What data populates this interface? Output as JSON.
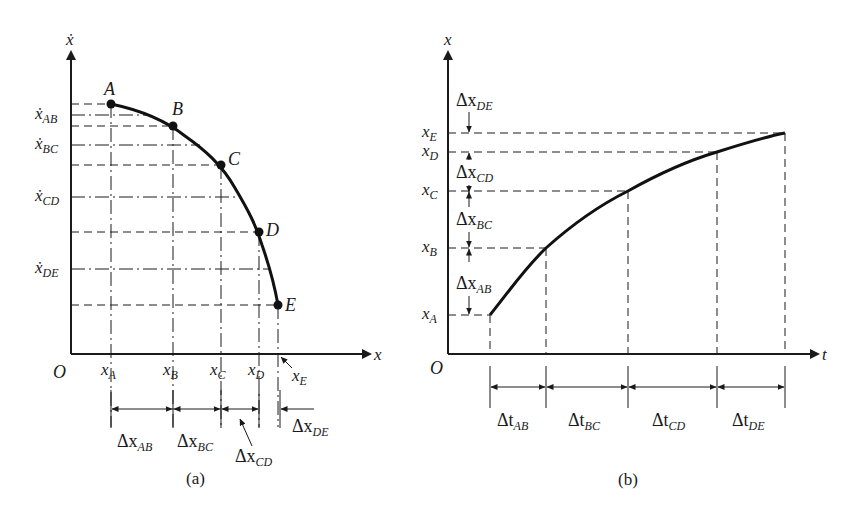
{
  "figure": {
    "panel_a": {
      "caption": "(a)",
      "y_axis_label": "ẋ",
      "x_axis_label": "x",
      "origin_label": "O",
      "points": [
        {
          "name": "A",
          "x": 111,
          "y": 104
        },
        {
          "name": "B",
          "x": 173,
          "y": 126
        },
        {
          "name": "C",
          "x": 221,
          "y": 165
        },
        {
          "name": "D",
          "x": 259,
          "y": 232
        },
        {
          "name": "E",
          "x": 278,
          "y": 305
        }
      ],
      "y_labels": [
        {
          "main": "ẋ",
          "sub": "AB",
          "y": 115
        },
        {
          "main": "ẋ",
          "sub": "BC",
          "y": 145
        },
        {
          "main": "ẋ",
          "sub": "CD",
          "y": 197
        },
        {
          "main": "ẋ",
          "sub": "DE",
          "y": 269
        }
      ],
      "x_labels": [
        {
          "main": "x",
          "sub": "A"
        },
        {
          "main": "x",
          "sub": "B"
        },
        {
          "main": "x",
          "sub": "C"
        },
        {
          "main": "x",
          "sub": "D"
        },
        {
          "main": "x",
          "sub": "E"
        }
      ],
      "intervals": [
        {
          "main": "Δx",
          "sub": "AB"
        },
        {
          "main": "Δx",
          "sub": "BC"
        },
        {
          "main": "Δx",
          "sub": "CD"
        },
        {
          "main": "Δx",
          "sub": "DE"
        }
      ]
    },
    "panel_b": {
      "caption": "(b)",
      "y_axis_label": "x",
      "x_axis_label": "t",
      "origin_label": "O",
      "points": [
        {
          "name": "A",
          "t": 490,
          "x": 315
        },
        {
          "name": "B",
          "t": 546,
          "x": 248
        },
        {
          "name": "C",
          "t": 628,
          "x": 191
        },
        {
          "name": "D",
          "t": 717,
          "x": 152
        },
        {
          "name": "E",
          "t": 785,
          "x": 133
        }
      ],
      "y_labels": [
        {
          "main": "x",
          "sub": "A"
        },
        {
          "main": "x",
          "sub": "B"
        },
        {
          "main": "x",
          "sub": "C"
        },
        {
          "main": "x",
          "sub": "D"
        },
        {
          "main": "x",
          "sub": "E"
        }
      ],
      "y_intervals": [
        {
          "main": "Δx",
          "sub": "AB"
        },
        {
          "main": "Δx",
          "sub": "BC"
        },
        {
          "main": "Δx",
          "sub": "CD"
        },
        {
          "main": "Δx",
          "sub": "DE"
        }
      ],
      "t_intervals": [
        {
          "main": "Δt",
          "sub": "AB"
        },
        {
          "main": "Δt",
          "sub": "BC"
        },
        {
          "main": "Δt",
          "sub": "CD"
        },
        {
          "main": "Δt",
          "sub": "DE"
        }
      ]
    }
  }
}
